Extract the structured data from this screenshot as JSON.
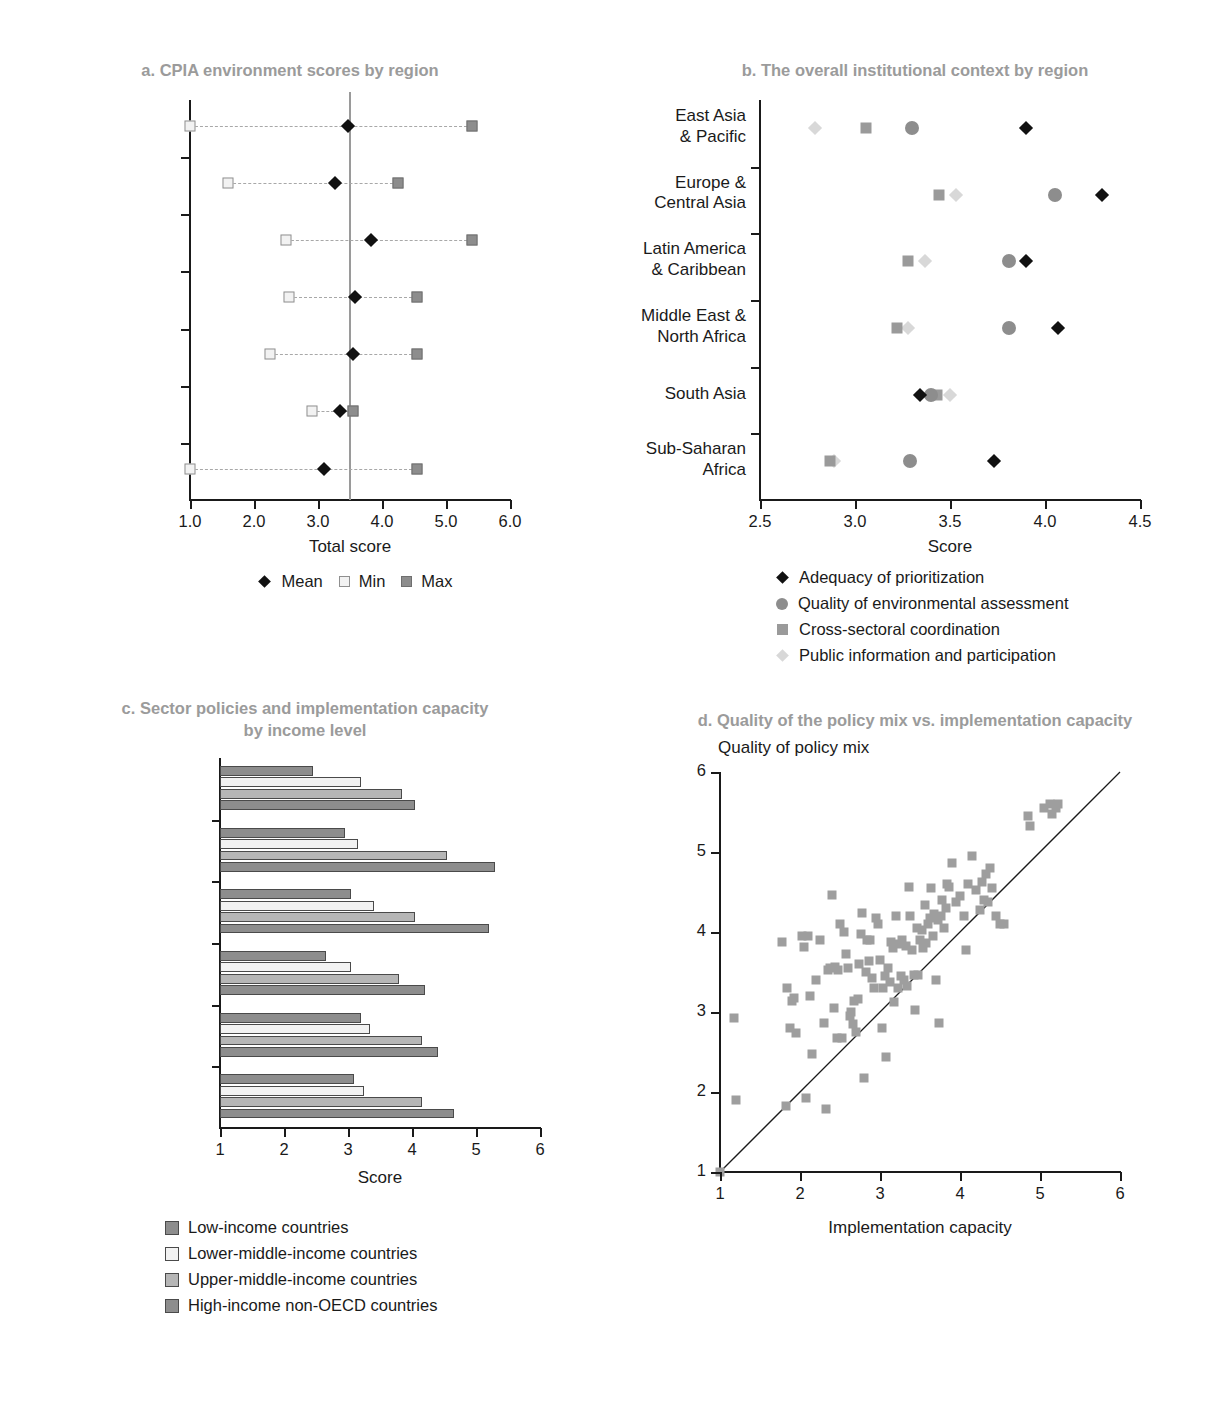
{
  "figure": {
    "panels": [
      "a",
      "b",
      "c",
      "d"
    ]
  },
  "panel_a": {
    "title": "a. CPIA environment scores by region",
    "xlabel": "Total score",
    "ticks": [
      "1.0",
      "2.0",
      "3.0",
      "4.0",
      "5.0",
      "6.0"
    ],
    "legend": [
      {
        "label": "Mean",
        "marker": "diamond"
      },
      {
        "label": "Min",
        "marker": "open-square"
      },
      {
        "label": "Max",
        "marker": "filled-square"
      }
    ]
  },
  "panel_b": {
    "title": "b. The overall institutional context by region",
    "xlabel": "Score",
    "ticks": [
      "2.5",
      "3.0",
      "3.5",
      "4.0",
      "4.5"
    ],
    "legend": [
      {
        "label": "Adequacy of prioritization",
        "marker": "diamond"
      },
      {
        "label": "Quality of environmental assessment",
        "marker": "circle"
      },
      {
        "label": "Cross-sectoral coordination",
        "marker": "square"
      },
      {
        "label": "Public information and participation",
        "marker": "light-diamond"
      }
    ]
  },
  "panel_c": {
    "title_line1": "c. Sector policies and implementation capacity",
    "title_line2": "by income level",
    "xlabel": "Score",
    "ticks": [
      "1",
      "2",
      "3",
      "4",
      "5",
      "6"
    ],
    "legend": [
      {
        "label": "Low-income countries",
        "color": "#8d8d8d"
      },
      {
        "label": "Lower-middle-income countries",
        "color": "#f2f2f2"
      },
      {
        "label": "Upper-middle-income countries",
        "color": "#b6b6b6"
      },
      {
        "label": "High-income non-OECD countries",
        "color": "#8d8d8d"
      }
    ]
  },
  "panel_d": {
    "title": "d. Quality of the policy mix vs. implementation capacity",
    "ylabel": "Quality of policy mix",
    "xlabel": "Implementation capacity",
    "xticks": [
      "1",
      "2",
      "3",
      "4",
      "5",
      "6"
    ],
    "yticks": [
      "1",
      "2",
      "3",
      "4",
      "5",
      "6"
    ]
  },
  "chart_data": [
    {
      "panel": "a",
      "type": "scatter",
      "title": "a. CPIA environment scores by region",
      "xlabel": "Total score",
      "ylabel": "",
      "xlim": [
        1.0,
        6.0
      ],
      "grid": false,
      "legend_position": "below",
      "categories": [
        "Sample",
        "East Asia & Pacific",
        "Europe & Central Asia",
        "Latin America & Caribbean",
        "Middle East & North Africa",
        "South Asia",
        "Sub-Saharan Africa"
      ],
      "reference_line": 3.5,
      "series": [
        {
          "name": "Mean",
          "values": [
            3.47,
            3.26,
            3.83,
            3.58,
            3.55,
            3.35,
            3.09
          ]
        },
        {
          "name": "Min",
          "values": [
            1.0,
            1.6,
            2.5,
            2.55,
            2.25,
            2.9,
            1.0
          ]
        },
        {
          "name": "Max",
          "values": [
            5.4,
            4.25,
            5.4,
            4.55,
            4.55,
            3.55,
            4.55
          ]
        }
      ]
    },
    {
      "panel": "b",
      "type": "scatter",
      "title": "b. The overall institutional context by region",
      "xlabel": "Score",
      "ylabel": "",
      "xlim": [
        2.5,
        4.5
      ],
      "grid": false,
      "legend_position": "below",
      "categories": [
        "East Asia & Pacific",
        "Europe & Central Asia",
        "Latin America & Caribbean",
        "Middle East & North Africa",
        "South Asia",
        "Sub-Saharan Africa"
      ],
      "series": [
        {
          "name": "Adequacy of prioritization",
          "values": [
            3.9,
            4.3,
            3.9,
            4.07,
            3.34,
            3.73
          ]
        },
        {
          "name": "Quality of environmental assessment",
          "values": [
            3.3,
            4.05,
            3.81,
            3.81,
            3.4,
            3.29
          ]
        },
        {
          "name": "Cross-sectoral coordination",
          "values": [
            3.06,
            3.44,
            3.28,
            3.22,
            3.43,
            2.87
          ]
        },
        {
          "name": "Public information and participation",
          "values": [
            2.79,
            3.53,
            3.37,
            3.28,
            3.5,
            2.89
          ]
        }
      ]
    },
    {
      "panel": "c",
      "type": "bar",
      "title": "c. Sector policies and implementation capacity by income level",
      "xlabel": "Score",
      "ylabel": "",
      "xlim": [
        1,
        6
      ],
      "grid": false,
      "orientation": "horizontal",
      "legend_position": "below",
      "categories": [
        "Air",
        "Waste",
        "Water",
        "Marine",
        "Ecosystem",
        "NRM"
      ],
      "series": [
        {
          "name": "Low-income countries",
          "values": [
            2.45,
            2.95,
            3.05,
            2.65,
            3.2,
            3.1
          ]
        },
        {
          "name": "Lower-middle-income countries",
          "values": [
            3.2,
            3.15,
            3.4,
            3.05,
            3.35,
            3.25
          ]
        },
        {
          "name": "Upper-middle-income countries",
          "values": [
            3.85,
            4.55,
            4.05,
            3.8,
            4.15,
            4.15
          ]
        },
        {
          "name": "High-income non-OECD countries",
          "values": [
            4.05,
            5.3,
            5.2,
            4.2,
            4.4,
            4.65
          ]
        }
      ]
    },
    {
      "panel": "d",
      "type": "scatter",
      "title": "d. Quality of the policy mix vs. implementation capacity",
      "xlabel": "Implementation capacity",
      "ylabel": "Quality of policy mix",
      "xlim": [
        1,
        6
      ],
      "ylim": [
        1,
        6
      ],
      "grid": false,
      "reference_line": {
        "type": "45-degree",
        "from": [
          1,
          1
        ],
        "to": [
          6,
          6
        ]
      },
      "points": [
        [
          1.0,
          1.0
        ],
        [
          1.18,
          2.93
        ],
        [
          1.2,
          1.9
        ],
        [
          1.78,
          3.88
        ],
        [
          1.82,
          1.82
        ],
        [
          1.84,
          3.3
        ],
        [
          1.88,
          2.8
        ],
        [
          1.9,
          3.14
        ],
        [
          1.92,
          3.18
        ],
        [
          1.95,
          2.74
        ],
        [
          2.02,
          3.95
        ],
        [
          2.05,
          3.81
        ],
        [
          2.08,
          1.92
        ],
        [
          2.1,
          3.95
        ],
        [
          2.12,
          3.2
        ],
        [
          2.15,
          2.48
        ],
        [
          2.2,
          3.4
        ],
        [
          2.25,
          3.9
        ],
        [
          2.3,
          2.86
        ],
        [
          2.32,
          1.79
        ],
        [
          2.35,
          3.52
        ],
        [
          2.38,
          3.55
        ],
        [
          2.4,
          4.46
        ],
        [
          2.42,
          3.05
        ],
        [
          2.44,
          3.56
        ],
        [
          2.46,
          2.68
        ],
        [
          2.48,
          3.52
        ],
        [
          2.5,
          4.1
        ],
        [
          2.52,
          2.68
        ],
        [
          2.55,
          4.0
        ],
        [
          2.58,
          3.72
        ],
        [
          2.6,
          3.55
        ],
        [
          2.62,
          2.95
        ],
        [
          2.64,
          3.0
        ],
        [
          2.66,
          2.85
        ],
        [
          2.68,
          3.14
        ],
        [
          2.7,
          2.75
        ],
        [
          2.72,
          3.16
        ],
        [
          2.74,
          3.6
        ],
        [
          2.76,
          3.98
        ],
        [
          2.78,
          4.24
        ],
        [
          2.8,
          2.18
        ],
        [
          2.82,
          3.5
        ],
        [
          2.84,
          3.9
        ],
        [
          2.86,
          3.64
        ],
        [
          2.88,
          3.9
        ],
        [
          2.9,
          3.42
        ],
        [
          2.92,
          3.3
        ],
        [
          2.95,
          4.18
        ],
        [
          2.98,
          4.1
        ],
        [
          3.0,
          3.65
        ],
        [
          3.02,
          2.8
        ],
        [
          3.04,
          3.3
        ],
        [
          3.06,
          3.45
        ],
        [
          3.08,
          2.44
        ],
        [
          3.1,
          3.55
        ],
        [
          3.12,
          3.38
        ],
        [
          3.14,
          3.88
        ],
        [
          3.16,
          3.8
        ],
        [
          3.18,
          3.12
        ],
        [
          3.2,
          4.2
        ],
        [
          3.22,
          3.3
        ],
        [
          3.24,
          3.85
        ],
        [
          3.26,
          3.45
        ],
        [
          3.28,
          3.9
        ],
        [
          3.3,
          3.4
        ],
        [
          3.32,
          3.82
        ],
        [
          3.34,
          3.32
        ],
        [
          3.36,
          4.56
        ],
        [
          3.38,
          4.2
        ],
        [
          3.4,
          3.78
        ],
        [
          3.42,
          3.46
        ],
        [
          3.44,
          3.02
        ],
        [
          3.46,
          4.05
        ],
        [
          3.48,
          3.46
        ],
        [
          3.5,
          3.9
        ],
        [
          3.52,
          4.02
        ],
        [
          3.54,
          3.8
        ],
        [
          3.56,
          4.34
        ],
        [
          3.58,
          3.86
        ],
        [
          3.6,
          4.1
        ],
        [
          3.62,
          4.18
        ],
        [
          3.64,
          4.55
        ],
        [
          3.66,
          3.95
        ],
        [
          3.68,
          4.22
        ],
        [
          3.7,
          3.4
        ],
        [
          3.72,
          4.15
        ],
        [
          3.74,
          2.86
        ],
        [
          3.76,
          4.2
        ],
        [
          3.78,
          4.4
        ],
        [
          3.8,
          4.05
        ],
        [
          3.82,
          4.3
        ],
        [
          3.84,
          4.6
        ],
        [
          3.86,
          4.56
        ],
        [
          3.9,
          4.86
        ],
        [
          3.95,
          4.38
        ],
        [
          4.0,
          4.45
        ],
        [
          4.05,
          4.2
        ],
        [
          4.08,
          3.78
        ],
        [
          4.1,
          4.6
        ],
        [
          4.15,
          4.95
        ],
        [
          4.2,
          4.52
        ],
        [
          4.25,
          4.28
        ],
        [
          4.28,
          4.62
        ],
        [
          4.3,
          4.4
        ],
        [
          4.32,
          4.72
        ],
        [
          4.35,
          4.38
        ],
        [
          4.38,
          4.8
        ],
        [
          4.4,
          4.55
        ],
        [
          4.45,
          4.2
        ],
        [
          4.5,
          4.1
        ],
        [
          4.55,
          4.1
        ],
        [
          4.85,
          5.45
        ],
        [
          4.88,
          5.32
        ],
        [
          5.05,
          5.55
        ],
        [
          5.12,
          5.6
        ],
        [
          5.15,
          5.48
        ],
        [
          5.2,
          5.55
        ],
        [
          5.22,
          5.6
        ]
      ]
    }
  ]
}
